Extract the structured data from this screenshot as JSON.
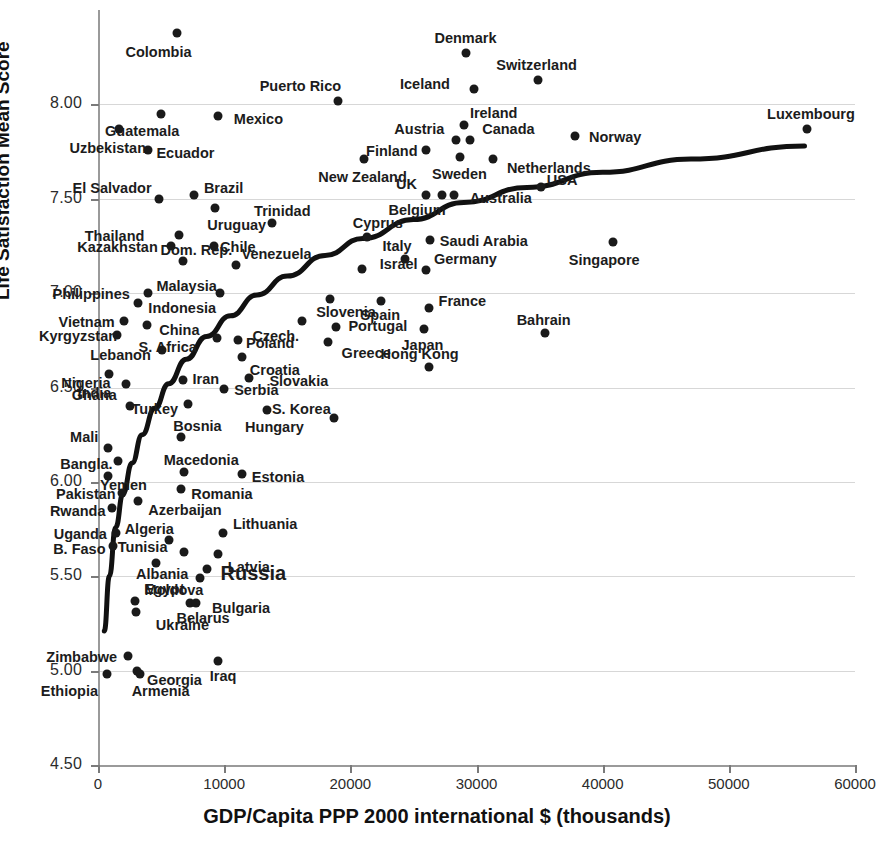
{
  "chart_data": {
    "type": "scatter",
    "title": "",
    "xlabel": "GDP/Capita PPP 2000 international $ (thousands)",
    "ylabel": "Life Satisfaction Mean Score",
    "xlim": [
      0,
      60000
    ],
    "ylim": [
      4.5,
      8.5
    ],
    "xticks": [
      0,
      10000,
      20000,
      30000,
      40000,
      50000,
      60000
    ],
    "xtick_labels": [
      "0",
      "10000",
      "20000",
      "30000",
      "40000",
      "50000",
      "60000"
    ],
    "yticks": [
      4.5,
      5.0,
      5.5,
      6.0,
      6.5,
      7.0,
      7.5,
      8.0
    ],
    "ytick_labels": [
      "4.50",
      "5.00",
      "5.50",
      "6.00",
      "6.50",
      "7.00",
      "7.50",
      "8.00"
    ],
    "grid": "horizontal",
    "legend": "none",
    "has_trendline": true,
    "trendline_type": "logarithmic",
    "point_color": "#1a1a1a",
    "gridline_color": "#d7d7d7",
    "axis_color": "#9a9a9a",
    "points": [
      {
        "name": "Colombia",
        "x": 6300,
        "y": 8.38,
        "lx": -52,
        "ly": 18
      },
      {
        "name": "Denmark",
        "x": 29200,
        "y": 8.27,
        "lx": -32,
        "ly": -16
      },
      {
        "name": "Switzerland",
        "x": 34900,
        "y": 8.13,
        "lx": -42,
        "ly": -16
      },
      {
        "name": "Iceland",
        "x": 29800,
        "y": 8.08,
        "lx": -74,
        "ly": -6
      },
      {
        "name": "Puerto Rico",
        "x": 19000,
        "y": 8.02,
        "lx": -78,
        "ly": -16
      },
      {
        "name": "Guatemala",
        "x": 5000,
        "y": 7.95,
        "lx": -56,
        "ly": 16
      },
      {
        "name": "Mexico",
        "x": 9500,
        "y": 7.94,
        "lx": 16,
        "ly": 2
      },
      {
        "name": "Ireland",
        "x": 29000,
        "y": 7.89,
        "lx": 6,
        "ly": -13
      },
      {
        "name": "Uzbekistan",
        "x": 1700,
        "y": 7.87,
        "lx": -50,
        "ly": 18
      },
      {
        "name": "Luxembourg",
        "x": 56200,
        "y": 7.87,
        "lx": -40,
        "ly": -16
      },
      {
        "name": "Norway",
        "x": 37800,
        "y": 7.83,
        "lx": 14,
        "ly": 0
      },
      {
        "name": "Austria",
        "x": 28400,
        "y": 7.81,
        "lx": -62,
        "ly": -12
      },
      {
        "name": "Canada",
        "x": 29500,
        "y": 7.81,
        "lx": 12,
        "ly": -12
      },
      {
        "name": "Ecuador",
        "x": 4000,
        "y": 7.76,
        "lx": 8,
        "ly": 2
      },
      {
        "name": "Finland",
        "x": 26000,
        "y": 7.76,
        "lx": -60,
        "ly": 0
      },
      {
        "name": "Sweden",
        "x": 28700,
        "y": 7.72,
        "lx": -28,
        "ly": 16
      },
      {
        "name": "Netherlands",
        "x": 31300,
        "y": 7.71,
        "lx": 14,
        "ly": 8
      },
      {
        "name": "New Zealand",
        "x": 21100,
        "y": 7.71,
        "lx": -46,
        "ly": 17
      },
      {
        "name": "Brazil",
        "x": 7600,
        "y": 7.52,
        "lx": 10,
        "ly": -8
      },
      {
        "name": "El Salvador",
        "x": 4800,
        "y": 7.5,
        "lx": -86,
        "ly": -12
      },
      {
        "name": "UK",
        "x": 26000,
        "y": 7.52,
        "lx": -30,
        "ly": -12
      },
      {
        "name": "Australia",
        "x": 28200,
        "y": 7.52,
        "lx": 16,
        "ly": 2
      },
      {
        "name": "Belgium",
        "x": 27300,
        "y": 7.52,
        "lx": -54,
        "ly": 14
      },
      {
        "name": "USA",
        "x": 35100,
        "y": 7.56,
        "lx": 6,
        "ly": -8
      },
      {
        "name": "Uruguay",
        "x": 9300,
        "y": 7.45,
        "lx": -8,
        "ly": 16
      },
      {
        "name": "Trinidad",
        "x": 13800,
        "y": 7.37,
        "lx": -18,
        "ly": -13
      },
      {
        "name": "Thailand",
        "x": 6400,
        "y": 7.31,
        "lx": -94,
        "ly": 0
      },
      {
        "name": "Cyprus",
        "x": 21300,
        "y": 7.3,
        "lx": -14,
        "ly": -15
      },
      {
        "name": "Saudi Arabia",
        "x": 26300,
        "y": 7.28,
        "lx": 10,
        "ly": 0
      },
      {
        "name": "Singapore",
        "x": 40800,
        "y": 7.27,
        "lx": -44,
        "ly": 17
      },
      {
        "name": "Kazakhstan",
        "x": 5800,
        "y": 7.25,
        "lx": -94,
        "ly": 0
      },
      {
        "name": "Chile",
        "x": 9200,
        "y": 7.25,
        "lx": 6,
        "ly": 0
      },
      {
        "name": "Venezuela",
        "x": 10900,
        "y": 7.15,
        "lx": 6,
        "ly": -12
      },
      {
        "name": "Dom. Rep.",
        "x": 6700,
        "y": 7.17,
        "lx": -22,
        "ly": -12
      },
      {
        "name": "Italy",
        "x": 24300,
        "y": 7.18,
        "lx": -22,
        "ly": -14
      },
      {
        "name": "Israel",
        "x": 20900,
        "y": 7.13,
        "lx": 18,
        "ly": -6
      },
      {
        "name": "Germany",
        "x": 26000,
        "y": 7.12,
        "lx": 8,
        "ly": -12
      },
      {
        "name": "Malaysia",
        "x": 9700,
        "y": 7.0,
        "lx": -64,
        "ly": -8
      },
      {
        "name": "Philippines",
        "x": 4000,
        "y": 7.0,
        "lx": -96,
        "ly": 0
      },
      {
        "name": "Indonesia",
        "x": 3200,
        "y": 6.95,
        "lx": 10,
        "ly": 4
      },
      {
        "name": "Slovenia",
        "x": 18400,
        "y": 6.97,
        "lx": -14,
        "ly": 12
      },
      {
        "name": "Spain",
        "x": 22400,
        "y": 6.96,
        "lx": -20,
        "ly": 13
      },
      {
        "name": "France",
        "x": 26200,
        "y": 6.92,
        "lx": 10,
        "ly": -8
      },
      {
        "name": "China",
        "x": 3900,
        "y": 6.83,
        "lx": 12,
        "ly": 4
      },
      {
        "name": "Vietnam",
        "x": 2100,
        "y": 6.85,
        "lx": -66,
        "ly": 0
      },
      {
        "name": "Czech.",
        "x": 16200,
        "y": 6.85,
        "lx": -50,
        "ly": 14
      },
      {
        "name": "Portugal",
        "x": 18900,
        "y": 6.82,
        "lx": 12,
        "ly": -2
      },
      {
        "name": "Japan",
        "x": 25800,
        "y": 6.81,
        "lx": -22,
        "ly": 15
      },
      {
        "name": "Bahrain",
        "x": 35400,
        "y": 6.79,
        "lx": -28,
        "ly": -14
      },
      {
        "name": "Kyrgyzstan",
        "x": 1500,
        "y": 6.78,
        "lx": -78,
        "ly": 0
      },
      {
        "name": "S. Africa",
        "x": 9400,
        "y": 6.76,
        "lx": -78,
        "ly": 8
      },
      {
        "name": "Poland",
        "x": 11100,
        "y": 6.75,
        "lx": 8,
        "ly": 2
      },
      {
        "name": "Greece",
        "x": 18200,
        "y": 6.74,
        "lx": 14,
        "ly": 10
      },
      {
        "name": "Lebanon",
        "x": 5100,
        "y": 6.7,
        "lx": -72,
        "ly": 4
      },
      {
        "name": "Croatia",
        "x": 11400,
        "y": 6.66,
        "lx": 8,
        "ly": 12
      },
      {
        "name": "Hong Kong",
        "x": 26200,
        "y": 6.61,
        "lx": -48,
        "ly": -14
      },
      {
        "name": "Nigeria",
        "x": 900,
        "y": 6.57,
        "lx": -48,
        "ly": 8
      },
      {
        "name": "Iran",
        "x": 6700,
        "y": 6.54,
        "lx": 10,
        "ly": -2
      },
      {
        "name": "Slovakia",
        "x": 12000,
        "y": 6.55,
        "lx": 20,
        "ly": 2
      },
      {
        "name": "Ghana",
        "x": 2200,
        "y": 6.52,
        "lx": -54,
        "ly": 10
      },
      {
        "name": "Serbia",
        "x": 10000,
        "y": 6.49,
        "lx": 10,
        "ly": 0
      },
      {
        "name": "India",
        "x": 2500,
        "y": 6.4,
        "lx": -52,
        "ly": -14
      },
      {
        "name": "Turkey",
        "x": 7100,
        "y": 6.41,
        "lx": -56,
        "ly": 4
      },
      {
        "name": "Hungary",
        "x": 13400,
        "y": 6.38,
        "lx": -22,
        "ly": 16
      },
      {
        "name": "S. Korea",
        "x": 18700,
        "y": 6.34,
        "lx": -62,
        "ly": -10
      },
      {
        "name": "Bosnia",
        "x": 6600,
        "y": 6.24,
        "lx": -8,
        "ly": -12
      },
      {
        "name": "Mali",
        "x": 800,
        "y": 6.18,
        "lx": -38,
        "ly": -12
      },
      {
        "name": "Bangla.",
        "x": 1600,
        "y": 6.11,
        "lx": -58,
        "ly": 2
      },
      {
        "name": "Macedonia",
        "x": 6800,
        "y": 6.05,
        "lx": -20,
        "ly": -13
      },
      {
        "name": "Estonia",
        "x": 11400,
        "y": 6.04,
        "lx": 10,
        "ly": 2
      },
      {
        "name": "Yemen",
        "x": 800,
        "y": 6.03,
        "lx": -8,
        "ly": 8
      },
      {
        "name": "Romania",
        "x": 6600,
        "y": 5.96,
        "lx": 10,
        "ly": 4
      },
      {
        "name": "Pakistan",
        "x": 1900,
        "y": 5.94,
        "lx": -66,
        "ly": 0
      },
      {
        "name": "Azerbaijan",
        "x": 3200,
        "y": 5.9,
        "lx": 10,
        "ly": 8
      },
      {
        "name": "Rwanda",
        "x": 1100,
        "y": 5.86,
        "lx": -62,
        "ly": 2
      },
      {
        "name": "Uganda",
        "x": 1400,
        "y": 5.73,
        "lx": -62,
        "ly": 0
      },
      {
        "name": "Lithuania",
        "x": 9900,
        "y": 5.73,
        "lx": 10,
        "ly": -10
      },
      {
        "name": "Algeria",
        "x": 5600,
        "y": 5.69,
        "lx": -44,
        "ly": -12
      },
      {
        "name": "B. Faso",
        "x": 1200,
        "y": 5.66,
        "lx": -60,
        "ly": 2
      },
      {
        "name": "Tunisia",
        "x": 6800,
        "y": 5.63,
        "lx": -66,
        "ly": -6
      },
      {
        "name": "Latvia",
        "x": 9500,
        "y": 5.62,
        "lx": 10,
        "ly": 12
      },
      {
        "name": "Albania",
        "x": 4600,
        "y": 5.57,
        "lx": -20,
        "ly": 10
      },
      {
        "name": "Russia",
        "x": 8600,
        "y": 5.54,
        "lx": 14,
        "ly": 0
      },
      {
        "name": "Egypt",
        "x": 8100,
        "y": 5.49,
        "lx": -56,
        "ly": 10
      },
      {
        "name": "Moldova",
        "x": 2900,
        "y": 5.37,
        "lx": 10,
        "ly": -12
      },
      {
        "name": "Bulgaria",
        "x": 7300,
        "y": 5.36,
        "lx": 22,
        "ly": 4
      },
      {
        "name": "Belarus",
        "x": 7800,
        "y": 5.36,
        "lx": -20,
        "ly": 14
      },
      {
        "name": "Ukraine",
        "x": 3000,
        "y": 5.31,
        "lx": 20,
        "ly": 12
      },
      {
        "name": "Zimbabwe",
        "x": 2400,
        "y": 5.08,
        "lx": -82,
        "ly": 0
      },
      {
        "name": "Georgia",
        "x": 3100,
        "y": 5.0,
        "lx": 10,
        "ly": 8
      },
      {
        "name": "Iraq",
        "x": 9500,
        "y": 5.05,
        "lx": -8,
        "ly": 14
      },
      {
        "name": "Armenia",
        "x": 3300,
        "y": 4.98,
        "lx": -8,
        "ly": 16
      },
      {
        "name": "Ethiopia",
        "x": 700,
        "y": 4.98,
        "lx": -66,
        "ly": 16
      }
    ],
    "trendline": [
      [
        500,
        5.21
      ],
      [
        900,
        5.5
      ],
      [
        1400,
        5.76
      ],
      [
        2000,
        5.94
      ],
      [
        2700,
        6.1
      ],
      [
        3500,
        6.25
      ],
      [
        4500,
        6.39
      ],
      [
        5600,
        6.52
      ],
      [
        7000,
        6.65
      ],
      [
        8600,
        6.77
      ],
      [
        10500,
        6.88
      ],
      [
        12600,
        6.99
      ],
      [
        15000,
        7.09
      ],
      [
        18000,
        7.2
      ],
      [
        21000,
        7.29
      ],
      [
        25000,
        7.39
      ],
      [
        29000,
        7.48
      ],
      [
        34000,
        7.56
      ],
      [
        40000,
        7.64
      ],
      [
        47000,
        7.71
      ],
      [
        56000,
        7.78
      ]
    ]
  }
}
